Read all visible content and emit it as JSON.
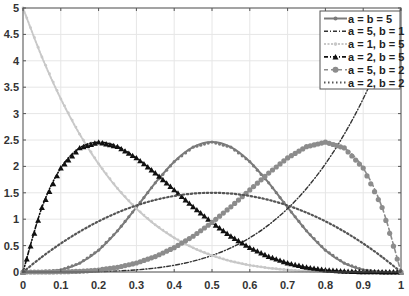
{
  "chart_data": {
    "type": "line",
    "title": "",
    "xlabel": "",
    "ylabel": "",
    "xlim": [
      0,
      1
    ],
    "ylim": [
      0,
      5
    ],
    "grid": true,
    "legend_position": "upper right",
    "x_ticks": [
      "0",
      "0.1",
      "0.2",
      "0.3",
      "0.4",
      "0.5",
      "0.6",
      "0.7",
      "0.8",
      "0.9",
      "1"
    ],
    "y_ticks": [
      "0",
      "0.5",
      "1",
      "1.5",
      "2",
      "2.5",
      "3",
      "3.5",
      "4",
      "4.5",
      "5"
    ],
    "x": [
      0,
      0.05,
      0.1,
      0.15,
      0.2,
      0.25,
      0.3,
      0.35,
      0.4,
      0.45,
      0.5,
      0.55,
      0.6,
      0.65,
      0.7,
      0.75,
      0.8,
      0.85,
      0.9,
      0.95,
      1
    ],
    "series": [
      {
        "name": "a = b = 5",
        "color": "#7a7a7a",
        "style": "solid-small-dots",
        "values": [
          0,
          0.003,
          0.041,
          0.167,
          0.413,
          0.779,
          1.225,
          1.688,
          2.09,
          2.364,
          2.461,
          2.364,
          2.09,
          1.688,
          1.225,
          0.779,
          0.413,
          0.167,
          0.041,
          0.003,
          0
        ]
      },
      {
        "name": "a = 5, b = 1",
        "color": "#333333",
        "style": "dash-dot",
        "values": [
          0,
          3e-05,
          0.0005,
          0.0025,
          0.008,
          0.0195,
          0.0405,
          0.075,
          0.128,
          0.205,
          0.3125,
          0.4575,
          0.648,
          0.8925,
          1.2005,
          1.582,
          2.048,
          2.61,
          3.2805,
          4.0725,
          5
        ]
      },
      {
        "name": "a = 1, b = 5",
        "color": "#c8c8c8",
        "style": "light-dotted",
        "values": [
          5,
          4.0725,
          3.2805,
          2.61,
          2.048,
          1.582,
          1.2005,
          0.8925,
          0.648,
          0.4575,
          0.3125,
          0.205,
          0.128,
          0.075,
          0.0405,
          0.0195,
          0.008,
          0.0025,
          0.0005,
          3e-05,
          0
        ]
      },
      {
        "name": "a = 2, b = 5",
        "color": "#111111",
        "style": "dash-dot-triangles",
        "values": [
          0,
          1.222,
          1.968,
          2.349,
          2.458,
          2.373,
          2.161,
          1.874,
          1.555,
          1.235,
          0.9375,
          0.677,
          0.461,
          0.293,
          0.17,
          0.088,
          0.038,
          0.013,
          0.003,
          0.0002,
          0
        ]
      },
      {
        "name": "a = 5, b = 2",
        "color": "#8c8c8c",
        "style": "dashed-circles",
        "values": [
          0,
          0.0002,
          0.003,
          0.013,
          0.038,
          0.088,
          0.17,
          0.293,
          0.461,
          0.677,
          0.9375,
          1.235,
          1.555,
          1.874,
          2.161,
          2.373,
          2.458,
          2.349,
          1.968,
          1.222,
          0
        ]
      },
      {
        "name": "a = 2, b = 2",
        "color": "#555555",
        "style": "dotted",
        "values": [
          0,
          0.285,
          0.54,
          0.765,
          0.96,
          1.125,
          1.26,
          1.365,
          1.44,
          1.485,
          1.5,
          1.485,
          1.44,
          1.365,
          1.26,
          1.125,
          0.96,
          0.765,
          0.54,
          0.285,
          0
        ]
      }
    ]
  }
}
